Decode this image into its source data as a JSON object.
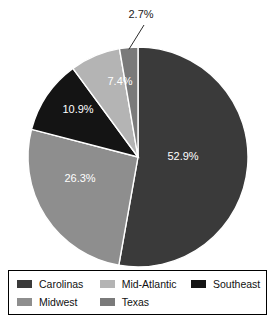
{
  "chart_data": {
    "type": "pie",
    "title": "",
    "categories": [
      "Carolinas",
      "Midwest",
      "Southeast",
      "Mid-Atlantic",
      "Texas"
    ],
    "values": [
      52.9,
      26.3,
      10.9,
      7.4,
      2.7
    ],
    "value_unit": "%",
    "data_labels": [
      "52.9%",
      "26.3%",
      "10.9%",
      "7.4%",
      "2.7%"
    ],
    "start_angle_deg": 0,
    "direction": "clockwise",
    "legend_position": "bottom",
    "grid": false,
    "colors": {
      "Carolinas": "#3a3a3a",
      "Midwest": "#8e8e8e",
      "Southeast": "#141414",
      "Mid-Atlantic": "#b4b4b4",
      "Texas": "#7a7a7a"
    },
    "slices": [
      {
        "label": "Carolinas",
        "value": 52.9,
        "data_label": "52.9%",
        "color": "#3a3a3a",
        "label_x": 183,
        "label_y": 160,
        "callout": false
      },
      {
        "label": "Midwest",
        "value": 26.3,
        "data_label": "26.3%",
        "color": "#8e8e8e",
        "label_x": 80,
        "label_y": 182,
        "callout": false
      },
      {
        "label": "Southeast",
        "value": 10.9,
        "data_label": "10.9%",
        "color": "#141414",
        "label_x": 78,
        "label_y": 113,
        "callout": false
      },
      {
        "label": "Mid-Atlantic",
        "value": 7.4,
        "data_label": "7.4%",
        "color": "#b4b4b4",
        "label_x": 120,
        "label_y": 85,
        "callout": false
      },
      {
        "label": "Texas",
        "value": 2.7,
        "data_label": "2.7%",
        "color": "#7a7a7a",
        "label_x": 141,
        "label_y": 18,
        "callout": true
      }
    ]
  },
  "legend": {
    "rows": [
      [
        {
          "label": "Carolinas",
          "color": "#3a3a3a"
        },
        {
          "label": "Mid-Atlantic",
          "color": "#b4b4b4"
        },
        {
          "label": "Southeast",
          "color": "#141414"
        }
      ],
      [
        {
          "label": "Midwest",
          "color": "#8e8e8e"
        },
        {
          "label": "Texas",
          "color": "#7a7a7a"
        }
      ]
    ]
  }
}
